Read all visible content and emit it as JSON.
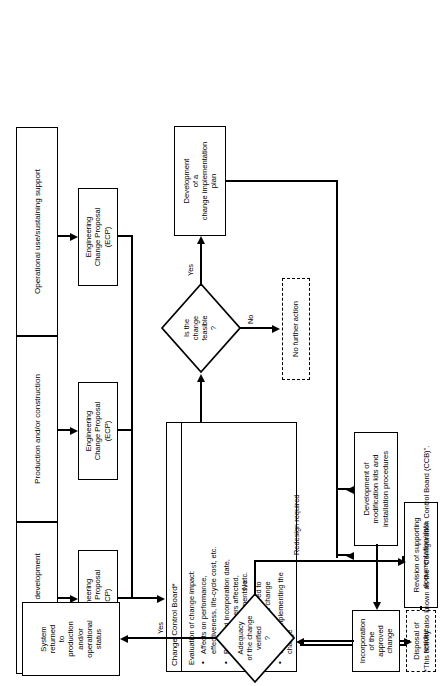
{
  "diagram": {
    "phases": [
      {
        "label": "Design and development"
      },
      {
        "label": "Production and/or construction"
      },
      {
        "label": "Operational use/sustaining support"
      }
    ],
    "ecp_boxes": [
      {
        "label": "Engineering\nChange Proposal\n(ECP)"
      },
      {
        "label": "Engineering\nChange Proposal\n(ECP)"
      },
      {
        "label": "Engineering\nChange Proposal\n(ECP)"
      }
    ],
    "ecp_lines": [
      "Engineering",
      "Change Proposal",
      "(ECP)"
    ],
    "ccb": {
      "title": "Change Control Board*",
      "intro": "Evaluation of change impact:",
      "bullets": [
        "Affects on performance,\neffectiveness, life-cycle cost, etc.",
        "Proposed incorporation date,\nserial numbers affected,\nretrofit requirements, etc.",
        "Resources required to\nimplement the change",
        "Cost of implementing the\nchange"
      ],
      "bullet_lines": [
        [
          "Affects on performance,",
          "effectiveness, life-cycle cost, etc."
        ],
        [
          "Proposed incorporation date,",
          "serial numbers affected,",
          "retrofit requirements, etc."
        ],
        [
          "Resources required to",
          "implement the change"
        ],
        [
          "Cost of implementing the",
          "change"
        ]
      ]
    },
    "decision_feasible": {
      "lines": [
        "Is the",
        "change",
        "feasible",
        "?"
      ],
      "yes_label": "Yes",
      "no_label": "No"
    },
    "no_further_action": {
      "label": "No further action"
    },
    "dev_plan": {
      "lines": [
        "Development",
        "of a",
        "change implementation",
        "plan"
      ]
    },
    "dev_mod_kits": {
      "lines": [
        "Development of",
        "modification kits and",
        "installation procedures"
      ]
    },
    "revision_docs": {
      "lines": [
        "Revision of supporting",
        "documentation/data"
      ]
    },
    "incorporation": {
      "lines": [
        "Incorporation",
        "of the",
        "approved change"
      ]
    },
    "disposal": {
      "label": "Disposal of residue"
    },
    "decision_adequacy": {
      "lines": [
        "Adequacy",
        "of the change",
        "verified",
        "?"
      ],
      "yes_label": "Yes",
      "no_label": "No"
    },
    "redesign": {
      "label": "Redesign required"
    },
    "system_returned": {
      "lines": [
        "System",
        "returned",
        "to",
        "production",
        "and/or",
        "operational",
        "status"
      ]
    },
    "footnote": "*This activity also known as the \"Configuration Control Board (CCB)\"."
  }
}
